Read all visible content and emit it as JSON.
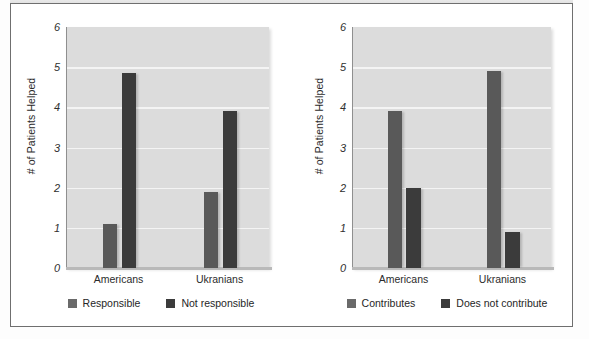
{
  "figure": {
    "background_color": "#ffffff",
    "frame_color": "#6f6f6f",
    "plot_background": "#dcdcdc",
    "gridline_color": "#f4f4f4",
    "series_colors": [
      "#595959",
      "#3b3b3b"
    ]
  },
  "chart_data": [
    {
      "type": "bar",
      "title": "",
      "xlabel": "",
      "ylabel": "# of Patients Helped",
      "ylim": [
        0,
        6
      ],
      "yticks": [
        0,
        1,
        2,
        3,
        4,
        5,
        6
      ],
      "grid": true,
      "legend_position": "bottom",
      "categories": [
        "Americans",
        "Ukranians"
      ],
      "series": [
        {
          "name": "Responsible",
          "values": [
            1.1,
            1.9
          ],
          "color": "#595959"
        },
        {
          "name": "Not responsible",
          "values": [
            4.85,
            3.9
          ],
          "color": "#3b3b3b"
        }
      ]
    },
    {
      "type": "bar",
      "title": "",
      "xlabel": "",
      "ylabel": "# of Patients Helped",
      "ylim": [
        0,
        6
      ],
      "yticks": [
        0,
        1,
        2,
        3,
        4,
        5,
        6
      ],
      "grid": true,
      "legend_position": "bottom",
      "categories": [
        "Americans",
        "Ukranians"
      ],
      "series": [
        {
          "name": "Contributes",
          "values": [
            3.9,
            4.9
          ],
          "color": "#595959"
        },
        {
          "name": "Does not contribute",
          "values": [
            2.0,
            0.9
          ],
          "color": "#3b3b3b"
        }
      ]
    }
  ],
  "panels": [
    {
      "axis_title": "# of Patients Helped",
      "ytick_labels": [
        "6",
        "5",
        "4",
        "3",
        "2",
        "1",
        "0"
      ],
      "xtick_labels": [
        "Americans",
        "Ukranians"
      ],
      "legend": [
        {
          "label": "Responsible",
          "swatch": "legend-swatch-responsible"
        },
        {
          "label": "Not responsible",
          "swatch": "legend-swatch-not-responsible"
        }
      ]
    },
    {
      "axis_title": "# of Patients Helped",
      "ytick_labels": [
        "6",
        "5",
        "4",
        "3",
        "2",
        "1",
        "0"
      ],
      "xtick_labels": [
        "Americans",
        "Ukranians"
      ],
      "legend": [
        {
          "label": "Contributes",
          "swatch": "legend-swatch-contributes"
        },
        {
          "label": "Does not contribute",
          "swatch": "legend-swatch-does-not-contribute"
        }
      ]
    }
  ]
}
